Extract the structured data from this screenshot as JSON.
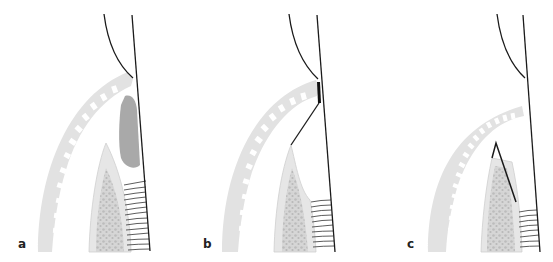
{
  "figure": {
    "panels": [
      {
        "id": "a",
        "label": "a"
      },
      {
        "id": "b",
        "label": "b"
      },
      {
        "id": "c",
        "label": "c"
      }
    ],
    "colors": {
      "outline": "#1a1a1a",
      "gingiva": "#e2e2e2",
      "dark_tissue": "#a9a9a9",
      "bone_outer": "#e6e6e6",
      "bone_inner": "#c4c4c4",
      "ligament": "#333333"
    }
  }
}
